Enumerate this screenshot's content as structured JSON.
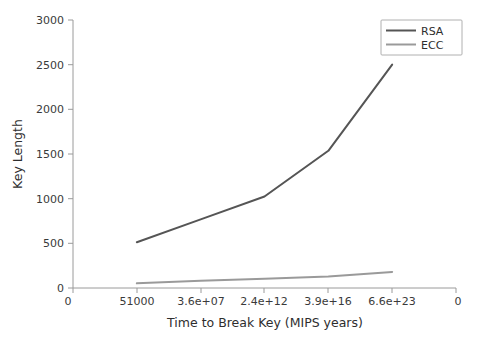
{
  "chart_data": {
    "type": "line",
    "title": "",
    "xlabel": "Time to Break Key (MIPS years)",
    "ylabel": "Key Length",
    "x_tick_labels": [
      "0",
      "51000",
      "3.6e+07",
      "2.4e+12",
      "3.9e+16",
      "6.6e+23",
      "0"
    ],
    "y_tick_labels": [
      "0",
      "500",
      "1000",
      "1500",
      "2000",
      "2500",
      "3000"
    ],
    "ylim": [
      0,
      3000
    ],
    "grid": false,
    "legend_position": "top-right",
    "categories": [
      "51000",
      "3.6e+07",
      "2.4e+12",
      "3.9e+16",
      "6.6e+23"
    ],
    "series": [
      {
        "name": "RSA",
        "color": "#555555",
        "values": [
          512,
          768,
          1024,
          1536,
          2500
        ]
      },
      {
        "name": "ECC",
        "color": "#9a9a9a",
        "values": [
          52,
          80,
          104,
          128,
          180
        ]
      }
    ]
  },
  "legend": {
    "items": [
      {
        "label": "RSA"
      },
      {
        "label": "ECC"
      }
    ]
  },
  "axes": {
    "x_title": "Time to Break Key (MIPS years)",
    "y_title": "Key Length"
  }
}
